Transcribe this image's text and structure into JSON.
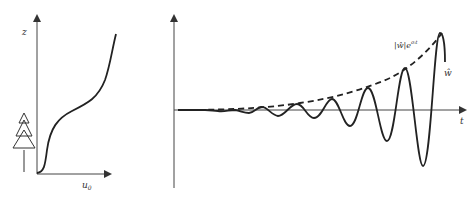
{
  "diagram": {
    "left_panel": {
      "y_axis_label": "z",
      "x_axis_label_base": "u",
      "x_axis_label_sub": "0",
      "icon": "tree-icon"
    },
    "right_panel": {
      "x_axis_label": "t",
      "envelope_label_abs": "|ŵ|e",
      "envelope_label_exp": "σᵢt",
      "wave_label": "ŵ",
      "envelope_style": "dashed",
      "wave_style": "solid"
    },
    "colors": {
      "stroke": "#222222",
      "axis": "#444444",
      "text": "#333333"
    }
  }
}
